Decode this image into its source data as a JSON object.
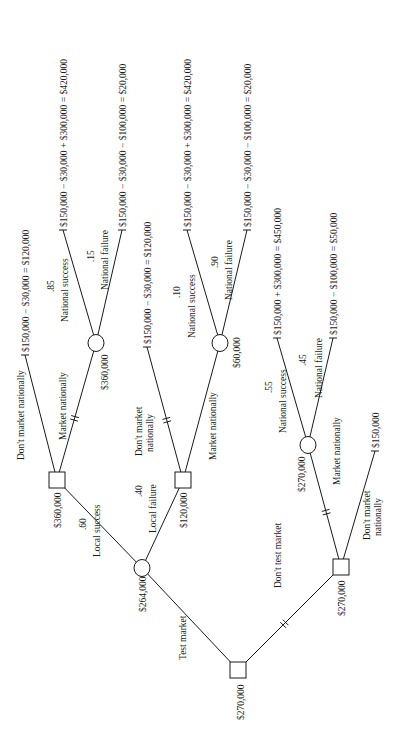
{
  "diagram": {
    "type": "decision-tree",
    "orientation": "rotated-90-ccw",
    "colors": {
      "line": "#1a1a1a",
      "background": "#ffffff"
    }
  },
  "nodes": [
    {
      "id": "root",
      "kind": "decision",
      "x": 238,
      "y": 670,
      "value": "$270,000",
      "vx": 244,
      "vy": 720
    },
    {
      "id": "c_test",
      "kind": "chance",
      "x": 142,
      "y": 568,
      "value": "$264,000",
      "vx": 146,
      "vy": 612
    },
    {
      "id": "d_ls",
      "kind": "decision",
      "x": 57,
      "y": 480,
      "value": "$360,000",
      "vx": 61,
      "vy": 528
    },
    {
      "id": "d_lf",
      "kind": "decision",
      "x": 183,
      "y": 480,
      "value": "$120,000",
      "vx": 187,
      "vy": 528
    },
    {
      "id": "c_ls_mn",
      "kind": "chance",
      "x": 96,
      "y": 343,
      "value": "$360,000",
      "vx": 108,
      "vy": 390
    },
    {
      "id": "c_lf_mn",
      "kind": "chance",
      "x": 220,
      "y": 343,
      "value": "$60,000",
      "vx": 240,
      "vy": 368
    },
    {
      "id": "d_nt",
      "kind": "decision",
      "x": 341,
      "y": 567,
      "value": "$270,000",
      "vx": 345,
      "vy": 616
    },
    {
      "id": "c_nt_mn",
      "kind": "chance",
      "x": 308,
      "y": 445,
      "value": "$270,000",
      "vx": 305,
      "vy": 492
    }
  ],
  "edges": [
    {
      "from": [
        238,
        670
      ],
      "to": [
        142,
        568
      ],
      "label": "Test market",
      "lx": 186,
      "ly": 660,
      "prob": "",
      "hash": false
    },
    {
      "from": [
        238,
        670
      ],
      "to": [
        341,
        567
      ],
      "label": "Don't test market",
      "lx": 281,
      "ly": 588,
      "prob": "",
      "hash": true
    },
    {
      "from": [
        142,
        568
      ],
      "to": [
        57,
        480
      ],
      "label": "Local success",
      "lx": 100,
      "ly": 557,
      "prob": ".60",
      "px": 86,
      "py": 530,
      "hash": false
    },
    {
      "from": [
        142,
        568
      ],
      "to": [
        183,
        480
      ],
      "label": "Local failure",
      "lx": 156,
      "ly": 533,
      "prob": ".40",
      "px": 142,
      "py": 497,
      "hash": false
    },
    {
      "from": [
        57,
        480
      ],
      "to": [
        25,
        355
      ],
      "label": "Don't market nationally",
      "lx": 24,
      "ly": 460,
      "prob": "",
      "hash": false
    },
    {
      "from": [
        57,
        480
      ],
      "to": [
        96,
        343
      ],
      "label": "Market nationally",
      "lx": 66,
      "ly": 440,
      "prob": "",
      "hash": true
    },
    {
      "from": [
        183,
        480
      ],
      "to": [
        147,
        347
      ],
      "label": "Don't market",
      "label2": "nationally",
      "lx": 142,
      "ly": 456,
      "prob": "",
      "hash": true
    },
    {
      "from": [
        183,
        480
      ],
      "to": [
        220,
        343
      ],
      "label": "Market nationally",
      "lx": 216,
      "ly": 460,
      "prob": "",
      "hash": false
    },
    {
      "from": [
        96,
        343
      ],
      "to": [
        63,
        230
      ],
      "label": "National success",
      "lx": 68,
      "ly": 322,
      "prob": ".85",
      "px": 54,
      "py": 292,
      "hash": false
    },
    {
      "from": [
        96,
        343
      ],
      "to": [
        122,
        230
      ],
      "label": "National failure",
      "lx": 108,
      "ly": 290,
      "prob": ".15",
      "px": 94,
      "py": 262,
      "hash": false
    },
    {
      "from": [
        220,
        343
      ],
      "to": [
        187,
        230
      ],
      "label": "National success",
      "lx": 195,
      "ly": 338,
      "prob": ".10",
      "px": 180,
      "py": 298,
      "hash": false
    },
    {
      "from": [
        220,
        343
      ],
      "to": [
        247,
        230
      ],
      "label": "National failure",
      "lx": 232,
      "ly": 300,
      "prob": ".90",
      "px": 218,
      "py": 268,
      "hash": false
    },
    {
      "from": [
        341,
        567
      ],
      "to": [
        308,
        445
      ],
      "label": "Market nationally",
      "lx": 340,
      "ly": 485,
      "prob": "",
      "hash": true
    },
    {
      "from": [
        341,
        567
      ],
      "to": [
        375,
        451
      ],
      "label": "Don't market",
      "label2": "nationally",
      "lx": 370,
      "ly": 540,
      "prob": "",
      "hash": false
    },
    {
      "from": [
        308,
        445
      ],
      "to": [
        277,
        338
      ],
      "label": "National success",
      "lx": 286,
      "ly": 433,
      "prob": ".55",
      "px": 272,
      "py": 393,
      "hash": false
    },
    {
      "from": [
        308,
        445
      ],
      "to": [
        333,
        338
      ],
      "label": "National failure",
      "lx": 322,
      "ly": 398,
      "prob": ".45",
      "px": 306,
      "py": 366,
      "hash": false
    }
  ],
  "terminals": [
    {
      "x": 25,
      "y": 355,
      "text": "$150,000  −  $30,000  =  $120,000"
    },
    {
      "x": 63,
      "y": 230,
      "text": "$150,000  −  $30,000  +  $300,000  =  $420,000"
    },
    {
      "x": 122,
      "y": 230,
      "text": "$150,000  −  $30,000  −  $100,000  =  $20,000"
    },
    {
      "x": 147,
      "y": 347,
      "text": "$150,000  −  $30,000  =  $120,000"
    },
    {
      "x": 187,
      "y": 230,
      "text": "$150,000  −  $30,000  +  $300,000  =  $420,000"
    },
    {
      "x": 247,
      "y": 230,
      "text": "$150,000  −  $30,000  −  $100,000  =  $20,000"
    },
    {
      "x": 277,
      "y": 338,
      "text": "$150,000  +  $300,000  =  $450,000"
    },
    {
      "x": 333,
      "y": 338,
      "text": "$150,000  −  $100,000  =  $50,000"
    },
    {
      "x": 375,
      "y": 451,
      "text": "$150,000"
    }
  ]
}
